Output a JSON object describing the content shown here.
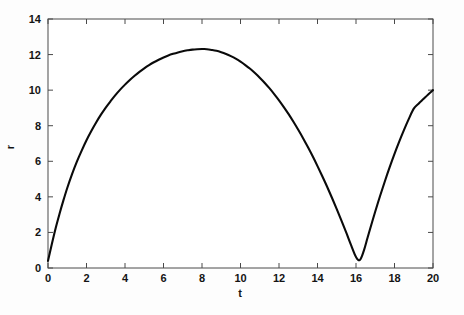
{
  "chart_data": {
    "type": "line",
    "title": "",
    "xlabel": "t",
    "ylabel": "r",
    "xlim": [
      0,
      20
    ],
    "ylim": [
      0,
      14
    ],
    "xticks": [
      0,
      2,
      4,
      6,
      8,
      10,
      12,
      14,
      16,
      18,
      20
    ],
    "yticks": [
      0,
      2,
      4,
      6,
      8,
      10,
      12,
      14
    ],
    "xtick_labels": [
      "0",
      "2",
      "4",
      "6",
      "8",
      "10",
      "12",
      "14",
      "16",
      "18",
      "20"
    ],
    "ytick_labels": [
      "0",
      "2",
      "4",
      "6",
      "8",
      "10",
      "12",
      "14"
    ],
    "grid": false,
    "legend": null,
    "legend_position": "none",
    "series": [
      {
        "name": "r",
        "color": "#0a0a0a",
        "linewidth": 2.1,
        "x": [
          0.0,
          0.2,
          0.4,
          0.6,
          0.8,
          1.0,
          1.25,
          1.5,
          1.75,
          2.0,
          2.25,
          2.5,
          2.75,
          3.0,
          3.25,
          3.5,
          3.75,
          4.0,
          4.25,
          4.5,
          4.75,
          5.0,
          5.25,
          5.5,
          5.75,
          6.0,
          6.25,
          6.5,
          6.75,
          7.0,
          7.25,
          7.5,
          7.75,
          8.0,
          8.1,
          8.25,
          8.5,
          8.75,
          9.0,
          9.25,
          9.5,
          9.75,
          10.0,
          10.25,
          10.5,
          10.75,
          11.0,
          11.25,
          11.5,
          11.75,
          12.0,
          12.25,
          12.5,
          12.75,
          13.0,
          13.25,
          13.5,
          13.75,
          14.0,
          14.25,
          14.5,
          14.75,
          15.0,
          15.25,
          15.5,
          15.75,
          16.0,
          16.2,
          16.4,
          16.6,
          16.8,
          17.0,
          17.25,
          17.5,
          17.75,
          18.0,
          18.25,
          18.5,
          18.75,
          19.0,
          19.25,
          19.5,
          19.75,
          20.0
        ],
        "y": [
          0.4,
          1.35,
          2.25,
          3.05,
          3.8,
          4.5,
          5.28,
          5.98,
          6.6,
          7.18,
          7.7,
          8.18,
          8.62,
          9.02,
          9.38,
          9.72,
          10.03,
          10.31,
          10.57,
          10.81,
          11.03,
          11.23,
          11.41,
          11.57,
          11.71,
          11.84,
          11.95,
          12.04,
          12.12,
          12.19,
          12.24,
          12.28,
          12.3,
          12.31,
          12.31,
          12.3,
          12.26,
          12.21,
          12.13,
          12.03,
          11.91,
          11.77,
          11.6,
          11.41,
          11.2,
          10.96,
          10.7,
          10.42,
          10.11,
          9.78,
          9.43,
          9.05,
          8.65,
          8.22,
          7.77,
          7.3,
          6.8,
          6.28,
          5.73,
          5.16,
          4.57,
          3.95,
          3.31,
          2.65,
          1.97,
          1.27,
          0.62,
          0.45,
          0.95,
          1.7,
          2.45,
          3.18,
          4.05,
          4.88,
          5.67,
          6.42,
          7.12,
          7.78,
          8.4,
          8.96,
          9.24,
          9.5,
          9.76,
          10.0
        ]
      }
    ],
    "annotations": {
      "maximum": {
        "t": 8.1,
        "r": 12.31
      },
      "minimum_cusp": {
        "t": 16.2,
        "r": 0.45
      },
      "start": {
        "t": 0,
        "r": 0.4
      },
      "end": {
        "t": 20,
        "r": 10.0
      }
    }
  },
  "axes": {
    "frame_color": "#4a4a4a",
    "background": "#ffffff",
    "tick_direction": "in"
  }
}
